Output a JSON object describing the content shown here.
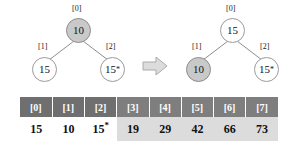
{
  "figure": {
    "caption": "",
    "arrow_label": "transforms-to"
  },
  "trees": [
    {
      "id": "before",
      "nodes": [
        {
          "index_label": "[0]",
          "value": "10",
          "star": "",
          "filled": true,
          "position": "root"
        },
        {
          "index_label": "[1]",
          "value": "15",
          "star": "",
          "filled": false,
          "position": "left"
        },
        {
          "index_label": "[2]",
          "value": "15",
          "star": "*",
          "filled": false,
          "position": "right"
        }
      ]
    },
    {
      "id": "after",
      "nodes": [
        {
          "index_label": "[0]",
          "value": "15",
          "star": "",
          "filled": false,
          "position": "root"
        },
        {
          "index_label": "[1]",
          "value": "10",
          "star": "",
          "filled": true,
          "position": "left"
        },
        {
          "index_label": "[2]",
          "value": "15",
          "star": "*",
          "filled": false,
          "position": "right"
        }
      ]
    }
  ],
  "array_table": {
    "headers": [
      "[0]",
      "[1]",
      "[2]",
      "[3]",
      "[4]",
      "[5]",
      "[6]",
      "[7]"
    ],
    "values": [
      "15",
      "10",
      "15",
      "19",
      "29",
      "42",
      "66",
      "73"
    ],
    "stars": [
      "",
      "",
      "*",
      "",
      "",
      "",
      "",
      ""
    ],
    "shaded_from_index": 3,
    "header_lighter_from_index": 3
  },
  "colors": {
    "node_fill_highlight": "#c9c9c9",
    "node_fill_plain": "#ffffff",
    "node_stroke": "#9a9a9a",
    "header_dark": "#6f6f6f",
    "header_light": "#7e7e7e",
    "value_shaded": "#dcdcdc",
    "arrow_fill": "#dcdcdc",
    "arrow_stroke": "#aaaaaa",
    "text": "#111111"
  }
}
